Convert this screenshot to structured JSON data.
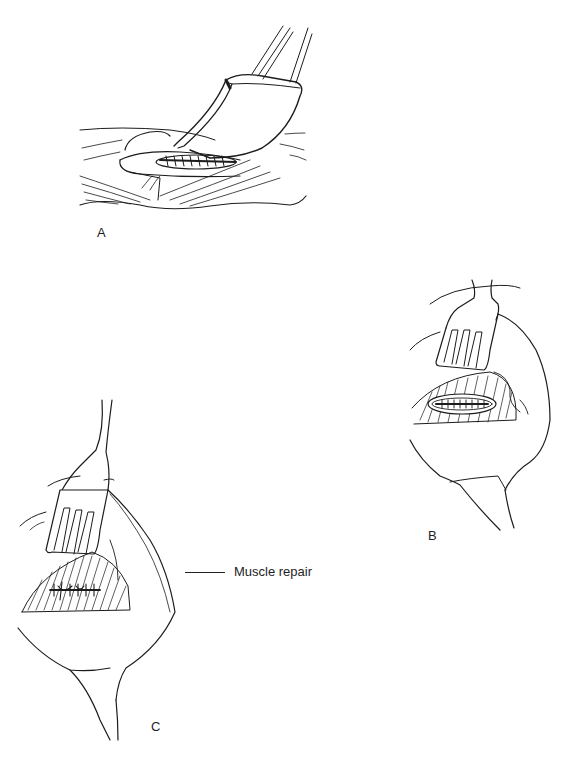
{
  "figure": {
    "panels": [
      {
        "id": "A",
        "label": "A",
        "description": "Retractor elevating tissue over incision with sutures"
      },
      {
        "id": "B",
        "label": "B",
        "description": "Retractor exposing elliptical sutured incision in muscle"
      },
      {
        "id": "C",
        "label": "C",
        "description": "Retractor exposing completed muscle repair"
      }
    ],
    "annotations": [
      {
        "panel": "C",
        "text": "Muscle repair"
      }
    ]
  }
}
